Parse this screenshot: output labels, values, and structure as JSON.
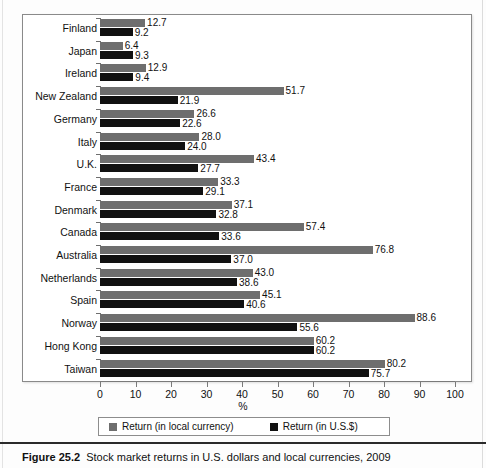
{
  "figure": {
    "caption_number": "Figure 25.2",
    "caption_text": "Stock market returns in U.S. dollars and local currencies, 2009"
  },
  "legend": {
    "position": "bottom-center",
    "items": [
      {
        "label": "Return (in local currency)",
        "color": "#6e6e6e",
        "key": "local"
      },
      {
        "label": "Return (in U.S.$)",
        "color": "#111111",
        "key": "usd"
      }
    ]
  },
  "axis": {
    "x_title": "%",
    "x_ticks": [
      "0",
      "10",
      "20",
      "30",
      "40",
      "50",
      "60",
      "70",
      "80",
      "90",
      "100"
    ]
  },
  "chart_data": {
    "type": "bar",
    "orientation": "horizontal",
    "title": "Stock market returns in U.S. dollars and local currencies, 2009",
    "xlabel": "%",
    "ylabel": "",
    "xlim": [
      0,
      100
    ],
    "xticks": [
      0,
      10,
      20,
      30,
      40,
      50,
      60,
      70,
      80,
      90,
      100
    ],
    "grid": false,
    "legend_position": "bottom-center",
    "categories": [
      "Finland",
      "Japan",
      "Ireland",
      "New Zealand",
      "Germany",
      "Italy",
      "U.K.",
      "France",
      "Denmark",
      "Canada",
      "Australia",
      "Netherlands",
      "Spain",
      "Norway",
      "Hong Kong",
      "Taiwan"
    ],
    "series": [
      {
        "name": "Return (in local currency)",
        "color": "#6e6e6e",
        "values": [
          12.7,
          6.4,
          12.9,
          51.7,
          26.6,
          28.0,
          43.4,
          33.3,
          37.1,
          57.4,
          76.8,
          43.0,
          45.1,
          88.6,
          60.2,
          80.2
        ]
      },
      {
        "name": "Return (in U.S.$)",
        "color": "#111111",
        "values": [
          9.2,
          9.3,
          9.4,
          21.9,
          22.6,
          24.0,
          27.7,
          29.1,
          32.8,
          33.6,
          37.0,
          38.6,
          40.6,
          55.6,
          60.2,
          75.7
        ]
      }
    ],
    "value_labels": [
      {
        "category": "Finland",
        "local": "12.7",
        "usd": "9.2"
      },
      {
        "category": "Japan",
        "local": "6.4",
        "usd": "9.3"
      },
      {
        "category": "Ireland",
        "local": "12.9",
        "usd": "9.4"
      },
      {
        "category": "New Zealand",
        "local": "51.7",
        "usd": "21.9"
      },
      {
        "category": "Germany",
        "local": "26.6",
        "usd": "22.6"
      },
      {
        "category": "Italy",
        "local": "28.0",
        "usd": "24.0"
      },
      {
        "category": "U.K.",
        "local": "43.4",
        "usd": "27.7"
      },
      {
        "category": "France",
        "local": "33.3",
        "usd": "29.1"
      },
      {
        "category": "Denmark",
        "local": "37.1",
        "usd": "32.8"
      },
      {
        "category": "Canada",
        "local": "57.4",
        "usd": "33.6"
      },
      {
        "category": "Australia",
        "local": "76.8",
        "usd": "37.0"
      },
      {
        "category": "Netherlands",
        "local": "43.0",
        "usd": "38.6"
      },
      {
        "category": "Spain",
        "local": "45.1",
        "usd": "40.6"
      },
      {
        "category": "Norway",
        "local": "88.6",
        "usd": "55.6"
      },
      {
        "category": "Hong Kong",
        "local": "60.2",
        "usd": "60.2"
      },
      {
        "category": "Taiwan",
        "local": "80.2",
        "usd": "75.7"
      }
    ]
  }
}
